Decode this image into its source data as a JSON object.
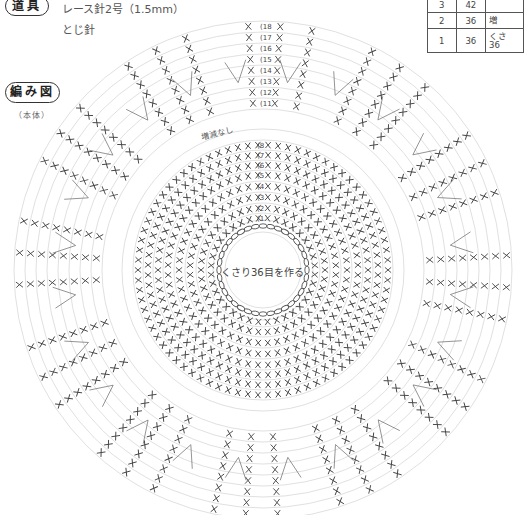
{
  "tools": {
    "heading": "道具",
    "items": [
      "レース針2号（1.5mm）",
      "とじ針"
    ]
  },
  "diagram": {
    "heading": "編み図",
    "subheading": "（本体）",
    "center_text": "くさり36目を作る",
    "no_change_note": "増減なし"
  },
  "table": {
    "rows": [
      {
        "round": "3",
        "stitches": "42",
        "note": ""
      },
      {
        "round": "2",
        "stitches": "36",
        "note": "増"
      },
      {
        "round": "1",
        "stitches": "36",
        "note": "くさ\n36"
      }
    ]
  },
  "chart_data": {
    "type": "crochet-round-diagram",
    "center": [
      263,
      270
    ],
    "chain_ring": {
      "radius": 44,
      "count": 36
    },
    "inner_rounds": [
      {
        "round": 1,
        "label": "1",
        "radius": 52
      },
      {
        "round": 2,
        "label": "2",
        "radius": 62
      },
      {
        "round": 3,
        "label": "3",
        "radius": 73
      },
      {
        "round": 4,
        "label": "4",
        "radius": 84
      },
      {
        "round": 5,
        "label": "5",
        "radius": 95
      },
      {
        "round": 6,
        "label": "6",
        "radius": 105
      },
      {
        "round": 7,
        "label": "7",
        "radius": 115
      },
      {
        "round": 8,
        "label": "8",
        "radius": 125
      }
    ],
    "outer_rounds": [
      {
        "round": 11,
        "label": "11",
        "radius": 167
      },
      {
        "round": 12,
        "label": "12",
        "radius": 178
      },
      {
        "round": 13,
        "label": "13",
        "radius": 189
      },
      {
        "round": 14,
        "label": "14",
        "radius": 200
      },
      {
        "round": 15,
        "label": "15",
        "radius": 211
      },
      {
        "round": 16,
        "label": "16",
        "radius": 222
      },
      {
        "round": 17,
        "label": "17",
        "radius": 233
      },
      {
        "round": 18,
        "label": "18",
        "radius": 244
      }
    ],
    "outer_spokes": 24,
    "stitch_symbol": "X",
    "colors": {
      "guide": "#d8d8d8",
      "stitch": "#444444",
      "chain": "#555555"
    }
  }
}
